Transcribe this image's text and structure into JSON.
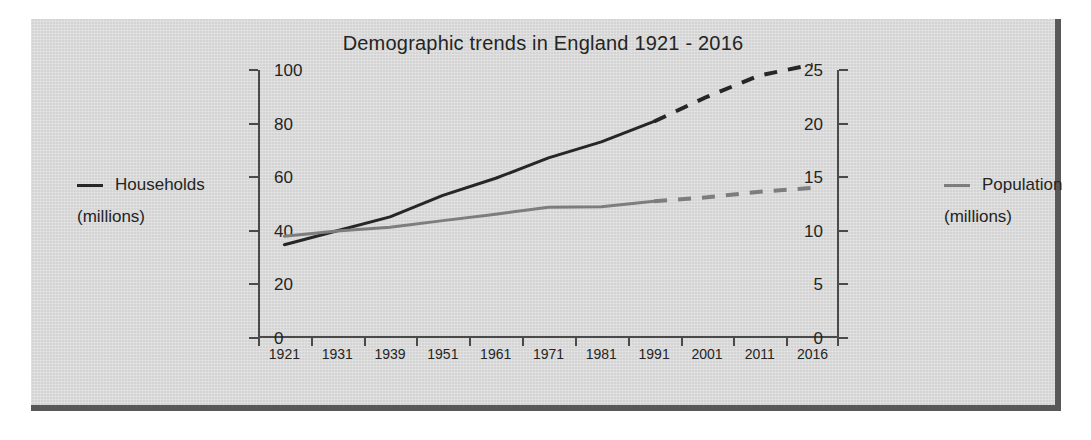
{
  "chart_data": {
    "type": "line",
    "title": "Demographic trends in England 1921 - 2016",
    "xlabel": "",
    "categories": [
      "1921",
      "1931",
      "1939",
      "1951",
      "1961",
      "1971",
      "1981",
      "1991",
      "2001",
      "2011",
      "2016"
    ],
    "grid": false,
    "axes": {
      "left": {
        "label": "Households (millions)",
        "ticks": [
          "0",
          "5",
          "10",
          "15",
          "20",
          "25"
        ],
        "ylim": [
          0,
          25
        ]
      },
      "right": {
        "label": "Population (millions)",
        "ticks": [
          "0",
          "20",
          "40",
          "60",
          "80",
          "100"
        ],
        "ylim": [
          0,
          100
        ]
      }
    },
    "series": [
      {
        "name": "Households",
        "unit": "millions",
        "axis": "left",
        "color": "#262626",
        "solid_values": [
          8.7,
          10.0,
          11.3,
          13.3,
          14.9,
          16.8,
          18.3,
          20.2
        ],
        "projected_values": [
          20.2,
          22.5,
          24.5,
          25.5
        ],
        "projection_starts": "1991",
        "values": [
          8.7,
          10.0,
          11.3,
          13.3,
          14.9,
          16.8,
          18.3,
          20.2,
          22.5,
          24.5,
          25.5
        ]
      },
      {
        "name": "Population",
        "unit": "millions",
        "axis": "right",
        "color": "#7d7d7d",
        "solid_values": [
          38.0,
          39.9,
          41.3,
          43.8,
          46.2,
          48.8,
          49.0,
          51.0
        ],
        "projected_values": [
          51.0,
          52.5,
          54.6,
          56.0
        ],
        "projection_starts": "1991",
        "values": [
          38.0,
          39.9,
          41.3,
          43.8,
          46.2,
          48.8,
          49.0,
          51.0,
          52.5,
          54.6,
          56.0
        ]
      }
    ]
  },
  "legend_left": {
    "name": "Households",
    "unit": "(millions)",
    "marker": "line-swatch-dark"
  },
  "legend_right": {
    "name": "Population",
    "unit": "(millions)",
    "marker": "line-swatch-gray"
  }
}
